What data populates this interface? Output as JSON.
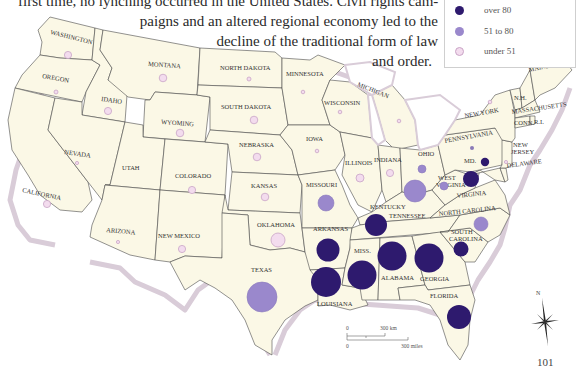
{
  "intro_text": {
    "line1": "first time, no lynching occurred in the United States. Civil rights cam-",
    "line2": "paigns and an altered regional economy led to the",
    "line3": "decline of the traditional form of law",
    "line4": "and order."
  },
  "legend": {
    "items": [
      {
        "label": "over 80",
        "color": "#2e1a6e"
      },
      {
        "label": "51 to 80",
        "color": "#9a88cc"
      },
      {
        "label": "under 51",
        "color": "#f3dcee"
      }
    ]
  },
  "colors": {
    "land": "#fbf8e6",
    "border": "#4a4a4a",
    "coast_shadow": "#d5c8d4",
    "high": "#2e1a6e",
    "mid": "#9a88cc",
    "low_fill": "#f3dcee",
    "low_stroke": "#c9a4c6"
  },
  "states": [
    {
      "name": "WASHINGTON",
      "category": "under 51"
    },
    {
      "name": "OREGON",
      "category": "under 51"
    },
    {
      "name": "CALIFORNIA",
      "category": "under 51"
    },
    {
      "name": "IDAHO",
      "category": "under 51"
    },
    {
      "name": "NEVADA",
      "category": "under 51"
    },
    {
      "name": "MONTANA",
      "category": "under 51"
    },
    {
      "name": "WYOMING",
      "category": "under 51"
    },
    {
      "name": "UTAH",
      "category": "none"
    },
    {
      "name": "COLORADO",
      "category": "under 51"
    },
    {
      "name": "ARIZONA",
      "category": "under 51"
    },
    {
      "name": "NEW MEXICO",
      "category": "under 51"
    },
    {
      "name": "NORTH DAKOTA",
      "category": "under 51"
    },
    {
      "name": "SOUTH DAKOTA",
      "category": "under 51"
    },
    {
      "name": "NEBRASKA",
      "category": "under 51"
    },
    {
      "name": "KANSAS",
      "category": "under 51"
    },
    {
      "name": "OKLAHOMA",
      "category": "under 51"
    },
    {
      "name": "TEXAS",
      "category": "51 to 80"
    },
    {
      "name": "MINNESOTA",
      "category": "under 51"
    },
    {
      "name": "IOWA",
      "category": "under 51"
    },
    {
      "name": "MISSOURI",
      "category": "51 to 80"
    },
    {
      "name": "ARKANSAS",
      "category": "over 80"
    },
    {
      "name": "LOUISIANA",
      "category": "over 80"
    },
    {
      "name": "WISCONSIN",
      "category": "under 51"
    },
    {
      "name": "MICHIGAN",
      "category": "under 51"
    },
    {
      "name": "ILLINOIS",
      "category": "under 51"
    },
    {
      "name": "INDIANA",
      "category": "under 51"
    },
    {
      "name": "OHIO",
      "category": "51 to 80"
    },
    {
      "name": "KENTUCKY",
      "category": "51 to 80"
    },
    {
      "name": "TENNESSEE",
      "category": "over 80"
    },
    {
      "name": "MISS.",
      "category": "over 80"
    },
    {
      "name": "ALABAMA",
      "category": "over 80"
    },
    {
      "name": "GEORGIA",
      "category": "over 80"
    },
    {
      "name": "FLORIDA",
      "category": "over 80"
    },
    {
      "name": "SOUTH CAROLINA",
      "category": "over 80"
    },
    {
      "name": "NORTH CAROLINA",
      "category": "51 to 80"
    },
    {
      "name": "VIRGINIA",
      "category": "over 80"
    },
    {
      "name": "WEST VIRGINIA",
      "category": "51 to 80"
    },
    {
      "name": "MD.",
      "category": "over 80"
    },
    {
      "name": "DELAWARE",
      "category": "under 51"
    },
    {
      "name": "PENNSYLVANIA",
      "category": "under 51"
    },
    {
      "name": "NEW JERSEY",
      "category": "under 51"
    },
    {
      "name": "NEW YORK",
      "category": "under 51"
    },
    {
      "name": "CONN.",
      "category": "none"
    },
    {
      "name": "R.I.",
      "category": "none"
    },
    {
      "name": "MASSACHUSETTS",
      "category": "none"
    },
    {
      "name": "N.H.",
      "category": "none"
    },
    {
      "name": "VT.",
      "category": "none"
    },
    {
      "name": "MAINE",
      "category": "under 51"
    }
  ],
  "labels": {
    "washington": "WASHINGTON",
    "oregon": "OREGON",
    "california": "CALIFORNIA",
    "idaho": "IDAHO",
    "nevada": "NEVADA",
    "montana": "MONTANA",
    "wyoming": "WYOMING",
    "utah": "UTAH",
    "colorado": "COLORADO",
    "arizona": "ARIZONA",
    "new_mexico": "NEW MEXICO",
    "north_dakota": "NORTH DAKOTA",
    "south_dakota": "SOUTH DAKOTA",
    "nebraska": "NEBRASKA",
    "kansas": "KANSAS",
    "oklahoma": "OKLAHOMA",
    "texas": "TEXAS",
    "minnesota": "MINNESOTA",
    "iowa": "IOWA",
    "missouri": "MISSOURI",
    "arkansas": "ARKANSAS",
    "louisiana": "LOUISIANA",
    "wisconsin": "WISCONSIN",
    "michigan": "MICHIGAN",
    "illinois": "ILLINOIS",
    "indiana": "INDIANA",
    "ohio": "OHIO",
    "kentucky": "KENTUCKY",
    "tennessee": "TENNESSEE",
    "miss": "MISS.",
    "alabama": "ALABAMA",
    "georgia": "GEORGIA",
    "florida": "FLORIDA",
    "south_carolina_1": "SOUTH",
    "south_carolina_2": "CAROLINA",
    "north_carolina": "NORTH CAROLINA",
    "virginia": "VIRGINIA",
    "west_virginia_1": "WEST",
    "west_virginia_2": "VIRGINIA",
    "md": "MD.",
    "delaware": "DELAWARE",
    "pennsylvania": "PENNSYLVANIA",
    "new_jersey_1": "NEW",
    "new_jersey_2": "JERSEY",
    "new_york": "NEW YORK",
    "conn": "CONN.",
    "ri": "R.I.",
    "massachusetts": "MASSACHUSETTS",
    "nh": "N.H.",
    "maine": "MAINE"
  },
  "scale_bar": {
    "km_zero": "0",
    "km_label": "300 km",
    "mi_zero": "0",
    "mi_label": "300 miles"
  },
  "compass": {
    "north_label": "N"
  },
  "page_number": "101"
}
